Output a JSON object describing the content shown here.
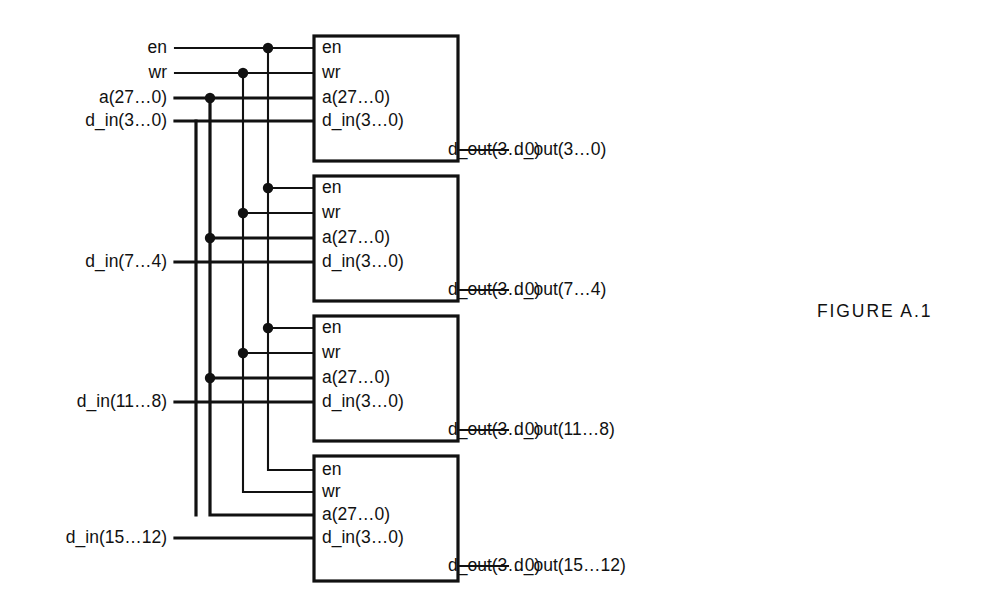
{
  "figure": {
    "caption": "FIGURE A.1",
    "caption_x": 817,
    "caption_y": 301
  },
  "canvas": {
    "width": 995,
    "height": 605,
    "background": "#ffffff"
  },
  "style": {
    "line_color": "#111111",
    "thin_stroke": 2.1,
    "bus_stroke": 3.2,
    "junction_radius": 5.2,
    "font_size": 17.5
  },
  "bus_columns": [
    {
      "name": "d_in_col",
      "x": 196,
      "kind": "bus"
    },
    {
      "name": "a_col",
      "x": 210,
      "kind": "bus"
    },
    {
      "name": "wr_col",
      "x": 243,
      "kind": "thin"
    },
    {
      "name": "en_col",
      "x": 268,
      "kind": "thin"
    }
  ],
  "external_inputs": [
    {
      "label": "en",
      "y": 48,
      "label_x": 167,
      "line_from": 175,
      "kind": "thin"
    },
    {
      "label": "wr",
      "y": 73,
      "label_x": 167,
      "line_from": 175,
      "kind": "thin"
    },
    {
      "label": "a(27…0)",
      "y": 98,
      "label_x": 167,
      "line_from": 175,
      "kind": "bus"
    },
    {
      "label": "d_in(3…0)",
      "y": 121,
      "label_x": 167,
      "line_from": 175,
      "kind": "bus"
    },
    {
      "label": "d_in(7…4)",
      "y": 262,
      "label_x": 167,
      "line_from": 175,
      "kind": "bus"
    },
    {
      "label": "d_in(11…8)",
      "y": 402,
      "label_x": 167,
      "line_from": 175,
      "kind": "bus"
    },
    {
      "label": "d_in(15…12)",
      "y": 538,
      "label_x": 167,
      "line_from": 175,
      "kind": "bus"
    }
  ],
  "blocks": [
    {
      "name": "memory-block-1",
      "x": 314,
      "y": 36,
      "width": 144,
      "height": 125,
      "ports_in": [
        {
          "label": "en",
          "y": 48,
          "kind": "thin"
        },
        {
          "label": "wr",
          "y": 73,
          "kind": "thin"
        },
        {
          "label": "a(27…0)",
          "y": 98,
          "kind": "bus"
        },
        {
          "label": "d_in(3…0)",
          "y": 121,
          "kind": "bus"
        }
      ],
      "port_out": {
        "label": "d_out(3…0)",
        "y": 150
      },
      "output": {
        "label": "d_out(3…0)",
        "y": 150,
        "line_to": 508,
        "label_x": 514
      }
    },
    {
      "name": "memory-block-2",
      "x": 314,
      "y": 176,
      "width": 144,
      "height": 125,
      "ports_in": [
        {
          "label": "en",
          "y": 188,
          "kind": "thin"
        },
        {
          "label": "wr",
          "y": 213,
          "kind": "thin"
        },
        {
          "label": "a(27…0)",
          "y": 238,
          "kind": "bus"
        },
        {
          "label": "d_in(3…0)",
          "y": 262,
          "kind": "bus"
        }
      ],
      "port_out": {
        "label": "d_out(3…0)",
        "y": 290
      },
      "output": {
        "label": "d_out(7…4)",
        "y": 290,
        "line_to": 508,
        "label_x": 514
      }
    },
    {
      "name": "memory-block-3",
      "x": 314,
      "y": 316,
      "width": 144,
      "height": 125,
      "ports_in": [
        {
          "label": "en",
          "y": 328,
          "kind": "thin"
        },
        {
          "label": "wr",
          "y": 353,
          "kind": "thin"
        },
        {
          "label": "a(27…0)",
          "y": 378,
          "kind": "bus"
        },
        {
          "label": "d_in(3…0)",
          "y": 402,
          "kind": "bus"
        }
      ],
      "port_out": {
        "label": "d_out(3…0)",
        "y": 430
      },
      "output": {
        "label": "d_out(11…8)",
        "y": 430,
        "line_to": 508,
        "label_x": 514
      }
    },
    {
      "name": "memory-block-4",
      "x": 314,
      "y": 456,
      "width": 144,
      "height": 125,
      "ports_in": [
        {
          "label": "en",
          "y": 470,
          "kind": "thin"
        },
        {
          "label": "wr",
          "y": 492,
          "kind": "thin"
        },
        {
          "label": "a(27…0)",
          "y": 515,
          "kind": "bus"
        },
        {
          "label": "d_in(3…0)",
          "y": 538,
          "kind": "bus"
        }
      ],
      "port_out": {
        "label": "d_out(3…0)",
        "y": 566
      },
      "output": {
        "label": "d_out(15…12)",
        "y": 566,
        "line_to": 508,
        "label_x": 514
      }
    }
  ],
  "junctions": [
    {
      "x": 268,
      "y": 48
    },
    {
      "x": 243,
      "y": 73
    },
    {
      "x": 210,
      "y": 98
    },
    {
      "x": 268,
      "y": 188
    },
    {
      "x": 243,
      "y": 213
    },
    {
      "x": 210,
      "y": 238
    },
    {
      "x": 268,
      "y": 328
    },
    {
      "x": 243,
      "y": 353
    },
    {
      "x": 210,
      "y": 378
    }
  ],
  "port_text_offsets": {
    "in_dx": 8,
    "out_dx_right_pad": 10
  }
}
